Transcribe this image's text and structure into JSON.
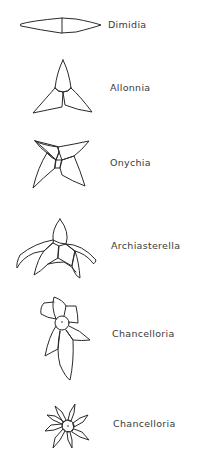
{
  "diagram": {
    "title": "",
    "items": [
      {
        "name": "Dimidia",
        "shape": "two-rayed-sclerite"
      },
      {
        "name": "Allonnia",
        "shape": "three-rayed-sclerite"
      },
      {
        "name": "Onychia",
        "shape": "four-rayed-sclerite"
      },
      {
        "name": "Archiasterella",
        "shape": "four-rayed-curved-sclerite"
      },
      {
        "name": "Chancelloria",
        "shape": "six-rayed-sclerite-with-central-disc"
      },
      {
        "name": "Chancelloria",
        "shape": "eight-rayed-star-sclerite-with-central-disc"
      }
    ]
  }
}
